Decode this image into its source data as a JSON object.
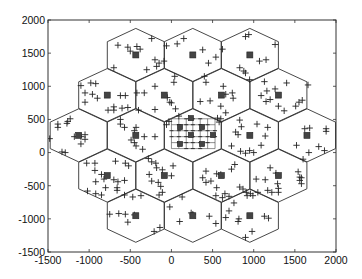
{
  "chart_data": {
    "type": "scatter",
    "title": "",
    "xlabel": "",
    "ylabel": "",
    "xlim": [
      -1500,
      2000
    ],
    "ylim": [
      -1500,
      2000
    ],
    "grid": false,
    "legend": null,
    "x_ticks": [
      -1500,
      -1000,
      -500,
      0,
      500,
      1000,
      1500,
      2000
    ],
    "y_ticks": [
      -1500,
      -1000,
      -500,
      0,
      500,
      1000,
      1500,
      2000
    ],
    "x_tick_labels": [
      "-1500",
      "-1000",
      "-500",
      "0",
      "500",
      "1000",
      "1500",
      "2000"
    ],
    "y_tick_labels": [
      "-1500",
      "-1000",
      "-500",
      "0",
      "500",
      "1000",
      "1500",
      "2000"
    ],
    "hex_cells": {
      "orientation": "pointy-top",
      "circumradius": 400,
      "centers": [
        [
          -433,
          1473
        ],
        [
          260,
          1473
        ],
        [
          953,
          1473
        ],
        [
          -780,
          867
        ],
        [
          -87,
          867
        ],
        [
          607,
          867
        ],
        [
          1300,
          867
        ],
        [
          -1127,
          260
        ],
        [
          -433,
          260
        ],
        [
          260,
          260
        ],
        [
          953,
          260
        ],
        [
          1647,
          260
        ],
        [
          -780,
          -347
        ],
        [
          -87,
          -347
        ],
        [
          607,
          -347
        ],
        [
          1300,
          -347
        ],
        [
          -433,
          -953
        ],
        [
          260,
          -953
        ],
        [
          953,
          -953
        ]
      ]
    },
    "base_stations": {
      "marker": "square",
      "points": [
        [
          -433,
          1473
        ],
        [
          260,
          1473
        ],
        [
          953,
          1473
        ],
        [
          -780,
          867
        ],
        [
          -87,
          867
        ],
        [
          607,
          867
        ],
        [
          1300,
          867
        ],
        [
          -1127,
          260
        ],
        [
          -433,
          260
        ],
        [
          953,
          260
        ],
        [
          1647,
          260
        ],
        [
          -780,
          -347
        ],
        [
          -87,
          -347
        ],
        [
          607,
          -347
        ],
        [
          1300,
          -347
        ],
        [
          -433,
          -953
        ],
        [
          260,
          -953
        ],
        [
          953,
          -953
        ]
      ]
    },
    "central_small_cells": {
      "marker": "square",
      "points": [
        [
          237,
          520
        ],
        [
          104,
          385
        ],
        [
          372,
          385
        ],
        [
          237,
          265
        ],
        [
          505,
          265
        ],
        [
          104,
          130
        ],
        [
          372,
          130
        ]
      ],
      "grid_x": [
        0,
        90,
        180,
        260,
        350,
        440,
        530
      ],
      "grid_y": [
        60,
        150,
        240,
        330,
        420,
        510
      ]
    },
    "users": {
      "marker": "plus",
      "points": [
        [
          -650,
          1620
        ],
        [
          -530,
          1590
        ],
        [
          -420,
          1600
        ],
        [
          -500,
          1530
        ],
        [
          -380,
          1560
        ],
        [
          -240,
          1720
        ],
        [
          -700,
          1280
        ],
        [
          -300,
          1250
        ],
        [
          -150,
          1350
        ],
        [
          -200,
          1400
        ],
        [
          -60,
          1610
        ],
        [
          70,
          1640
        ],
        [
          150,
          1720
        ],
        [
          380,
          1550
        ],
        [
          540,
          1440
        ],
        [
          450,
          1350
        ],
        [
          -90,
          1380
        ],
        [
          -180,
          1300
        ],
        [
          620,
          1560
        ],
        [
          900,
          1750
        ],
        [
          940,
          1780
        ],
        [
          1150,
          1400
        ],
        [
          1070,
          1380
        ],
        [
          830,
          1280
        ],
        [
          880,
          1230
        ],
        [
          900,
          1200
        ],
        [
          950,
          1100
        ],
        [
          1260,
          1630
        ],
        [
          -1100,
          1010
        ],
        [
          -980,
          1050
        ],
        [
          -920,
          1040
        ],
        [
          -1050,
          900
        ],
        [
          -960,
          880
        ],
        [
          -900,
          820
        ],
        [
          -1050,
          760
        ],
        [
          -620,
          860
        ],
        [
          -560,
          860
        ],
        [
          -420,
          900
        ],
        [
          -700,
          690
        ],
        [
          -770,
          640
        ],
        [
          -530,
          680
        ],
        [
          -400,
          640
        ],
        [
          -700,
          640
        ],
        [
          -200,
          1000
        ],
        [
          -330,
          900
        ],
        [
          40,
          1150
        ],
        [
          30,
          1060
        ],
        [
          -50,
          830
        ],
        [
          -20,
          760
        ],
        [
          -200,
          650
        ],
        [
          50,
          660
        ],
        [
          0,
          750
        ],
        [
          400,
          1150
        ],
        [
          420,
          1060
        ],
        [
          630,
          1000
        ],
        [
          660,
          880
        ],
        [
          740,
          900
        ],
        [
          750,
          820
        ],
        [
          350,
          770
        ],
        [
          470,
          780
        ],
        [
          600,
          700
        ],
        [
          660,
          600
        ],
        [
          1130,
          1070
        ],
        [
          1160,
          930
        ],
        [
          1260,
          960
        ],
        [
          1400,
          1050
        ],
        [
          1090,
          860
        ],
        [
          1200,
          800
        ],
        [
          1150,
          770
        ],
        [
          1300,
          700
        ],
        [
          1370,
          630
        ],
        [
          1510,
          700
        ],
        [
          1550,
          760
        ],
        [
          1590,
          790
        ],
        [
          1660,
          1020
        ],
        [
          -1380,
          430
        ],
        [
          -1380,
          380
        ],
        [
          -1260,
          470
        ],
        [
          -1230,
          510
        ],
        [
          -1270,
          440
        ],
        [
          -1180,
          240
        ],
        [
          -1100,
          240
        ],
        [
          -1050,
          270
        ],
        [
          -1050,
          200
        ],
        [
          -1100,
          130
        ],
        [
          -1480,
          210
        ],
        [
          -1330,
          10
        ],
        [
          -1290,
          0
        ],
        [
          -430,
          380
        ],
        [
          -450,
          330
        ],
        [
          -490,
          190
        ],
        [
          -450,
          150
        ],
        [
          -430,
          100
        ],
        [
          -330,
          240
        ],
        [
          -200,
          240
        ],
        [
          -620,
          500
        ],
        [
          -620,
          430
        ],
        [
          -570,
          380
        ],
        [
          -350,
          50
        ],
        [
          -600,
          670
        ],
        [
          -60,
          420
        ],
        [
          -30,
          470
        ],
        [
          90,
          550
        ],
        [
          560,
          520
        ],
        [
          600,
          510
        ],
        [
          580,
          460
        ],
        [
          830,
          490
        ],
        [
          850,
          390
        ],
        [
          780,
          310
        ],
        [
          810,
          270
        ],
        [
          1040,
          430
        ],
        [
          1170,
          380
        ],
        [
          1140,
          250
        ],
        [
          1090,
          110
        ],
        [
          1000,
          0
        ],
        [
          900,
          -10
        ],
        [
          950,
          30
        ],
        [
          730,
          100
        ],
        [
          840,
          20
        ],
        [
          1680,
          370
        ],
        [
          1620,
          360
        ],
        [
          1880,
          360
        ],
        [
          1880,
          320
        ],
        [
          1520,
          110
        ],
        [
          1670,
          0
        ],
        [
          1790,
          90
        ],
        [
          1860,
          30
        ],
        [
          1600,
          -100
        ],
        [
          -1030,
          -160
        ],
        [
          -930,
          -160
        ],
        [
          -930,
          -270
        ],
        [
          -920,
          -440
        ],
        [
          -820,
          -400
        ],
        [
          -850,
          -330
        ],
        [
          -700,
          -410
        ],
        [
          -650,
          -440
        ],
        [
          -570,
          -420
        ],
        [
          -800,
          -530
        ],
        [
          -850,
          -640
        ],
        [
          -660,
          -530
        ],
        [
          -660,
          -570
        ],
        [
          -1020,
          -580
        ],
        [
          -920,
          -620
        ],
        [
          -560,
          -160
        ],
        [
          -520,
          -200
        ],
        [
          -680,
          -130
        ],
        [
          -240,
          -140
        ],
        [
          -190,
          -160
        ],
        [
          -180,
          -230
        ],
        [
          -110,
          -260
        ],
        [
          -270,
          -330
        ],
        [
          -240,
          -430
        ],
        [
          -160,
          -450
        ],
        [
          -130,
          -510
        ],
        [
          0,
          -350
        ],
        [
          20,
          -200
        ],
        [
          -280,
          -90
        ],
        [
          420,
          -280
        ],
        [
          550,
          -320
        ],
        [
          600,
          -330
        ],
        [
          380,
          -380
        ],
        [
          420,
          -450
        ],
        [
          480,
          -430
        ],
        [
          550,
          -530
        ],
        [
          650,
          -620
        ],
        [
          830,
          -520
        ],
        [
          870,
          -550
        ],
        [
          910,
          -600
        ],
        [
          960,
          -620
        ],
        [
          1050,
          -600
        ],
        [
          730,
          -250
        ],
        [
          770,
          -180
        ],
        [
          1200,
          -230
        ],
        [
          1270,
          -310
        ],
        [
          1140,
          -410
        ],
        [
          1030,
          -400
        ],
        [
          1290,
          -470
        ],
        [
          1300,
          -540
        ],
        [
          1300,
          -600
        ],
        [
          1540,
          -290
        ],
        [
          1560,
          -370
        ],
        [
          1560,
          -420
        ],
        [
          1580,
          -380
        ],
        [
          1580,
          -470
        ],
        [
          1170,
          -570
        ],
        [
          1220,
          -600
        ],
        [
          -750,
          -930
        ],
        [
          -640,
          -920
        ],
        [
          -560,
          -930
        ],
        [
          -530,
          -1050
        ],
        [
          -450,
          -940
        ],
        [
          -370,
          -650
        ],
        [
          -570,
          -640
        ],
        [
          -210,
          -1190
        ],
        [
          -140,
          -1130
        ],
        [
          -470,
          -670
        ],
        [
          -20,
          -820
        ],
        [
          130,
          -670
        ],
        [
          240,
          -910
        ],
        [
          260,
          -930
        ],
        [
          100,
          -1040
        ],
        [
          540,
          -1070
        ],
        [
          460,
          -960
        ],
        [
          540,
          -650
        ],
        [
          -110,
          -600
        ],
        [
          -150,
          -640
        ],
        [
          700,
          -880
        ],
        [
          660,
          -980
        ],
        [
          820,
          -1000
        ],
        [
          810,
          -1040
        ],
        [
          760,
          -760
        ],
        [
          900,
          -1280
        ],
        [
          980,
          -1190
        ],
        [
          1180,
          -990
        ],
        [
          1130,
          -960
        ],
        [
          920,
          -650
        ],
        [
          990,
          -650
        ],
        [
          620,
          -680
        ],
        [
          700,
          -660
        ]
      ]
    }
  },
  "figure": {
    "width": 362,
    "height": 279,
    "plot_box": {
      "left": 48,
      "top": 20,
      "right": 336,
      "bottom": 252
    },
    "colors": {
      "background": "#ffffff",
      "line": "#333333",
      "marker": "#222222",
      "base_station_fill": "#444444"
    }
  }
}
